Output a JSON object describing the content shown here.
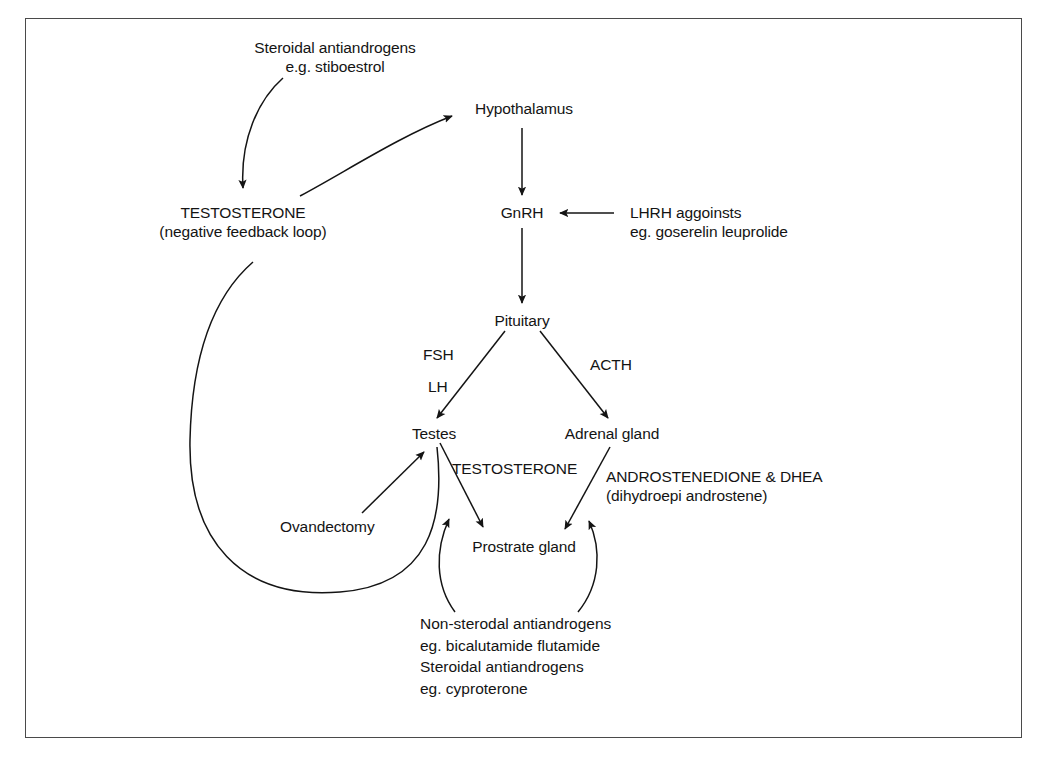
{
  "figure": {
    "caption_partial": ""
  },
  "nodes": {
    "steroidal_antiandrogens_top": {
      "line1": "Steroidal antiandrogens",
      "line2": "e.g. stiboestrol"
    },
    "hypothalamus": "Hypothalamus",
    "testosterone_feedback": {
      "line1": "TESTOSTERONE",
      "line2": "(negative feedback loop)"
    },
    "gnrh": "GnRH",
    "lhrh_agonists": {
      "line1": "LHRH aggoinsts",
      "line2": "eg. goserelin leuprolide"
    },
    "pituitary": "Pituitary",
    "fsh": "FSH",
    "lh": "LH",
    "acth": "ACTH",
    "testes": "Testes",
    "adrenal_gland": "Adrenal gland",
    "ovandectomy": "Ovandectomy",
    "testosterone_pathway": "TESTOSTERONE",
    "androstenedione": {
      "line1": "ANDROSTENEDIONE & DHEA",
      "line2": "(dihydroepi androstene)"
    },
    "prostate_gland": "Prostrate gland",
    "antiandrogens_bottom": {
      "line1": "Non-sterodal antiandrogens",
      "line2": "eg. bicalutamide flutamide",
      "line3": "Steroidal antiandrogens",
      "line4": "eg. cyproterone"
    }
  },
  "colors": {
    "ink": "#141414",
    "frame": "#4a4a4a",
    "background": "#ffffff"
  },
  "edges": [
    {
      "from": "steroidal-antiandrogens-top",
      "to": "testosterone-feedback",
      "style": "curved-arrow"
    },
    {
      "from": "testosterone-feedback",
      "to": "hypothalamus",
      "style": "curved-arrow"
    },
    {
      "from": "hypothalamus",
      "to": "gnrh",
      "style": "straight-arrow"
    },
    {
      "from": "lhrh-agonists",
      "to": "gnrh",
      "style": "straight-arrow"
    },
    {
      "from": "gnrh",
      "to": "pituitary",
      "style": "straight-arrow"
    },
    {
      "from": "pituitary",
      "to": "testes",
      "label": "FSH LH",
      "style": "straight-arrow"
    },
    {
      "from": "pituitary",
      "to": "adrenal-gland",
      "label": "ACTH",
      "style": "straight-arrow"
    },
    {
      "from": "ovandectomy",
      "to": "testes",
      "style": "straight-arrow"
    },
    {
      "from": "testes",
      "to": "prostate-gland",
      "label": "TESTOSTERONE",
      "style": "straight-arrow"
    },
    {
      "from": "adrenal-gland",
      "to": "prostate-gland",
      "label": "ANDROSTENEDIONE & DHEA",
      "style": "straight-arrow"
    },
    {
      "from": "testes",
      "to": "testosterone-feedback",
      "style": "long-feedback-loop"
    },
    {
      "from": "antiandrogens-bottom",
      "to": "testosterone-pathway-arrow",
      "style": "curved-arrow"
    },
    {
      "from": "antiandrogens-bottom",
      "to": "androstenedione-pathway-arrow",
      "style": "curved-arrow"
    }
  ]
}
